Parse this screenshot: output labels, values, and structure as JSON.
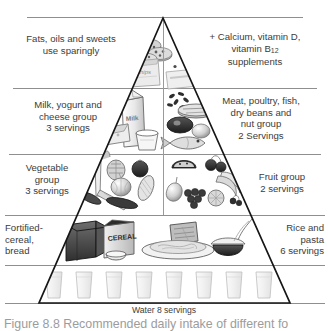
{
  "figure": {
    "caption": "Figure 8.8 Recommended daily intake of different fo",
    "water_label": "Water 8 servings"
  },
  "pyramid": {
    "apex": {
      "x": 163,
      "y": 18
    },
    "base_left": {
      "x": 39,
      "y": 303
    },
    "base_right": {
      "x": 290,
      "y": 303
    },
    "outline_color": "#1a1a1a",
    "divider_color": "#8c8c8c",
    "tier_divider_y": [
      17,
      88,
      154,
      215,
      265,
      303
    ]
  },
  "tiers": [
    {
      "id": "fats-supplements",
      "left_label": "Fats, oils and sweets\nuse sparingly",
      "right_label": "+ Calcium, vitamin D,\nvitamin B12\nsupplements",
      "right_label_pre": "+ Calcium, vitamin D,",
      "right_label_mid": "vitamin B",
      "right_label_sub": "12",
      "right_label_post": "supplements",
      "foods": [
        "cookies",
        "chips-bag",
        "candy-bar"
      ]
    },
    {
      "id": "milk-meat",
      "left_label": "Milk, yogurt and\ncheese group\n3 servings",
      "right_label": "Meat, poultry, fish,\ndry beans and\nnut group\n2 Servings",
      "foods": [
        "milk-carton",
        "cheese-wedge",
        "yogurt-cup",
        "beans",
        "steak",
        "liver",
        "egg",
        "fish"
      ]
    },
    {
      "id": "vegetable-fruit",
      "left_label": "Vegetable\ngroup\n3 servings",
      "right_label": "Fruit group\n2 servings",
      "foods": [
        "leek",
        "artichoke",
        "tomato",
        "onion",
        "corn",
        "carrot",
        "cucumber",
        "watermelon",
        "cherries",
        "banana",
        "pear",
        "grapes",
        "orange",
        "berries"
      ]
    },
    {
      "id": "cereal-rice",
      "left_label": "Fortified-\ncereal,\nbread",
      "right_label": "Rice and\npasta\n6 servings",
      "cereal_box_text": "CEREAL",
      "foods": [
        "bread-loaf",
        "cereal-box",
        "cereal-bowl",
        "toast",
        "pasta-plate",
        "rice-bowl"
      ]
    },
    {
      "id": "water",
      "glass_count": 8,
      "foods": [
        "water-glass"
      ]
    }
  ]
}
